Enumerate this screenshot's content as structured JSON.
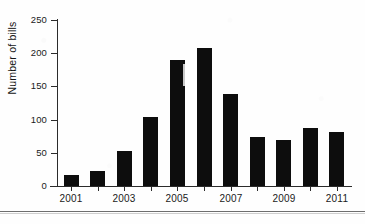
{
  "chart_data": {
    "type": "bar",
    "title": "",
    "xlabel": "",
    "ylabel": "Number of bills",
    "categories": [
      "2001",
      "2002",
      "2003",
      "2004",
      "2005",
      "2006",
      "2007",
      "2008",
      "2009",
      "2010",
      "2011"
    ],
    "values": [
      17,
      23,
      53,
      104,
      190,
      208,
      139,
      74,
      69,
      88,
      82
    ],
    "ylim": [
      0,
      250
    ],
    "y_ticks": [
      0,
      50,
      100,
      150,
      200,
      250
    ],
    "y_tick_labels": [
      "0",
      "50",
      "100",
      "150",
      "200",
      "250"
    ],
    "x_tick_labels": [
      "2001",
      "2003",
      "2005",
      "2007",
      "2009",
      "2011"
    ],
    "x_labeled_categories": [
      "2001",
      "2003",
      "2005",
      "2007",
      "2009",
      "2011"
    ],
    "grid": false,
    "legend": false,
    "legend_position": "none",
    "bar_color": "#0d0d0d",
    "axis_color": "#2b2b2b",
    "background_color": "#ffffff"
  },
  "figure": {
    "y_axis_title": "Number of bills",
    "bottom_rule_color": "#6e6e6e"
  }
}
